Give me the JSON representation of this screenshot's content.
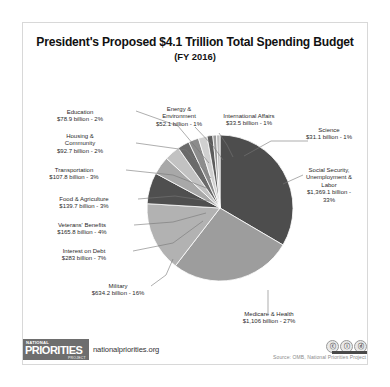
{
  "chart": {
    "title": "President's Proposed $4.1 Trillion Total Spending Budget",
    "subtitle": "(FY 2016)"
  },
  "footer": {
    "logo_top": "NATIONAL",
    "logo_main": "PRIORITIES",
    "logo_sub": "PROJECT",
    "site": "nationalpriorities.org",
    "source": "Source: OMB, National Priorities Project",
    "cc_badges": [
      "ⓒ",
      "ⓘ",
      "ⓓ"
    ]
  },
  "chart_data": {
    "type": "pie",
    "title": "President's Proposed $4.1 Trillion Total Spending Budget (FY 2016)",
    "unit": "billion USD",
    "total_label": "$4.1 Trillion",
    "legend": "none",
    "labels_outside": true,
    "categories": [
      "Social Security, Unemployment & Labor",
      "Medicare & Health",
      "Military",
      "Interest on Debt",
      "Veterans' Benefits",
      "Food & Agriculture",
      "Transportation",
      "Housing & Community",
      "Education",
      "Energy & Environment",
      "International Affairs",
      "Science"
    ],
    "values": [
      1369.1,
      1106,
      634.2,
      283,
      165.8,
      139.7,
      107.8,
      92.7,
      78.9,
      52.1,
      33.5,
      31.1
    ],
    "percents": [
      33,
      27,
      16,
      7,
      4,
      3,
      3,
      2,
      2,
      1,
      1,
      1
    ],
    "value_labels": [
      "$1,369.1 billion -",
      "$1,106 billion - 27%",
      "$634.2 billion - 16%",
      "$283 billion - 7%",
      "$165.8 billion - 4%",
      "$139.7 billion - 3%",
      "$107.8 billion - 3%",
      "$92.7 billion - 2%",
      "$78.9 billion - 2%",
      "$52.1 billion - 1%",
      "$33.5 billion - 1%",
      "$31.1 billion - 1%"
    ],
    "colors": [
      "#4d4d4d",
      "#9d9d9d",
      "#b2b2b2",
      "#4f4f4f",
      "#a8a8a8",
      "#c2c2c2",
      "#6a6a6a",
      "#8c8c8c",
      "#d0d0d0",
      "#5c5c5c",
      "#9a9a9a",
      "#bdbdbd"
    ]
  },
  "slice_labels": {
    "social_security": {
      "line1": "Social Security,",
      "line2": "Unemployment &",
      "line3": "Labor",
      "line4": "$1,369.1 billion -",
      "line5": "33%"
    },
    "medicare": {
      "name": "Medicare & Health",
      "value": "$1,106 billion - 27%"
    },
    "military": {
      "name": "Military",
      "value": "$634.2 billion - 16%"
    },
    "interest": {
      "name": "Interest on Debt",
      "value": "$283 billion - 7%"
    },
    "veterans": {
      "name": "Veterans' Benefits",
      "value": "$165.8 billion - 4%"
    },
    "food": {
      "name": "Food & Agriculture",
      "value": "$139.7 billion - 3%"
    },
    "transportation": {
      "name": "Transportation",
      "value": "$107.8 billion - 3%"
    },
    "housing": {
      "name1": "Housing &",
      "name2": "Community",
      "value": "$92.7 billion - 2%"
    },
    "education": {
      "name": "Education",
      "value": "$78.9 billion - 2%"
    },
    "energy": {
      "name1": "Energy &",
      "name2": "Environment",
      "value": "$52.1 billion - 1%"
    },
    "international": {
      "name": "International  Affairs",
      "value": "$33.5 billion - 1%"
    },
    "science": {
      "name": "Science",
      "value": "$31.1 billion - 1%"
    }
  }
}
